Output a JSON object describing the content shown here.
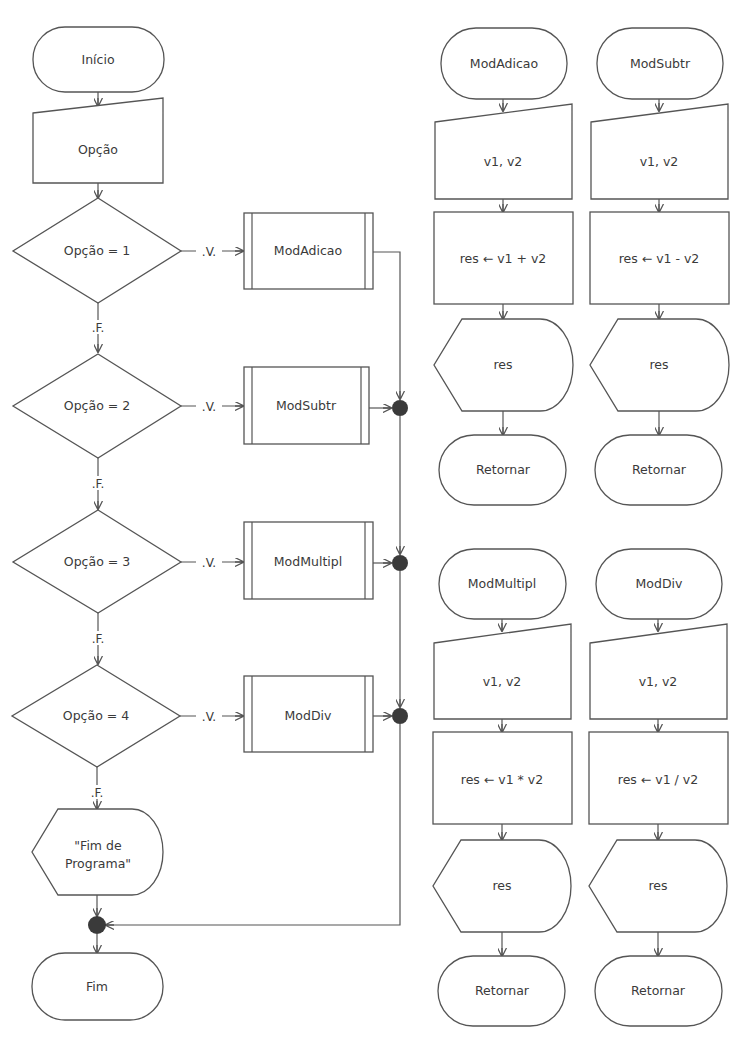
{
  "main_flow": {
    "start": "Início",
    "input": "Opção",
    "decisions": [
      {
        "condition": "Opção = 1",
        "true_label": ".V.",
        "false_label": ".F.",
        "call": "ModAdicao"
      },
      {
        "condition": "Opção = 2",
        "true_label": ".V.",
        "false_label": ".F.",
        "call": "ModSubtr"
      },
      {
        "condition": "Opção = 3",
        "true_label": ".V.",
        "false_label": ".F.",
        "call": "ModMultipl"
      },
      {
        "condition": "Opção = 4",
        "true_label": ".V.",
        "false_label": ".F.",
        "call": "ModDiv"
      }
    ],
    "output_line1": "\"Fim de",
    "output_line2": "Programa\"",
    "end": "Fim"
  },
  "modules": [
    {
      "name": "ModAdicao",
      "input": "v1, v2",
      "process": "res ← v1 + v2",
      "output": "res",
      "return": "Retornar"
    },
    {
      "name": "ModSubtr",
      "input": "v1, v2",
      "process": "res ← v1 - v2",
      "output": "res",
      "return": "Retornar"
    },
    {
      "name": "ModMultipl",
      "input": "v1, v2",
      "process": "res ← v1 * v2",
      "output": "res",
      "return": "Retornar"
    },
    {
      "name": "ModDiv",
      "input": "v1, v2",
      "process": "res ← v1 / v2",
      "output": "res",
      "return": "Retornar"
    }
  ],
  "colors": {
    "stroke": "#555555",
    "text": "#3a3a3a",
    "connector": "#3a3a3a",
    "background": "#ffffff"
  }
}
